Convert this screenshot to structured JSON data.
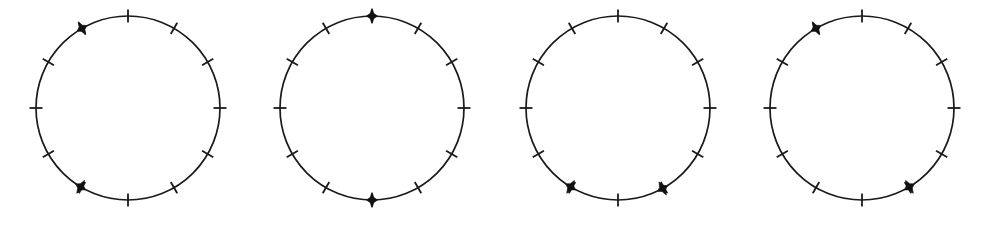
{
  "figure": {
    "kind": "geometry-diagram",
    "background_color": "#ffffff",
    "stroke_color": "#1a1a1a",
    "marker_color": "#111111",
    "canvas": {
      "width": 989,
      "height": 225
    },
    "circle_radius": 92,
    "tick_count": 12,
    "tick_length": 13,
    "tick_stroke_width": 1.8,
    "circle_stroke_width": 1.7,
    "marker_radius_x": 5.5,
    "marker_radius_y": 7.5,
    "panels": [
      {
        "id": "panel-1",
        "label": "circle-1",
        "center_x": 128,
        "center_y": 108,
        "tick_angles_deg": [
          0,
          30,
          60,
          90,
          120,
          150,
          180,
          210,
          240,
          270,
          300,
          330
        ],
        "markers": [
          {
            "name": "marker-a",
            "angle_deg": 330,
            "clock_position": "11"
          },
          {
            "name": "marker-b",
            "angle_deg": 211,
            "clock_position": "7"
          }
        ]
      },
      {
        "id": "panel-2",
        "label": "circle-2",
        "center_x": 372,
        "center_y": 108,
        "tick_angles_deg": [
          0,
          30,
          60,
          90,
          120,
          150,
          180,
          210,
          240,
          270,
          300,
          330
        ],
        "markers": [
          {
            "name": "marker-a",
            "angle_deg": 0,
            "clock_position": "12"
          },
          {
            "name": "marker-b",
            "angle_deg": 180,
            "clock_position": "6"
          }
        ]
      },
      {
        "id": "panel-3",
        "label": "circle-3",
        "center_x": 618,
        "center_y": 108,
        "tick_angles_deg": [
          0,
          30,
          60,
          90,
          120,
          150,
          180,
          210,
          240,
          270,
          300,
          330
        ],
        "markers": [
          {
            "name": "marker-a",
            "angle_deg": 211,
            "clock_position": "7"
          },
          {
            "name": "marker-b",
            "angle_deg": 151,
            "clock_position": "5"
          }
        ]
      },
      {
        "id": "panel-4",
        "label": "circle-4",
        "center_x": 862,
        "center_y": 108,
        "tick_angles_deg": [
          0,
          30,
          60,
          90,
          120,
          150,
          180,
          210,
          240,
          270,
          300,
          330
        ],
        "markers": [
          {
            "name": "marker-a",
            "angle_deg": 330,
            "clock_position": "11"
          },
          {
            "name": "marker-b",
            "angle_deg": 149,
            "clock_position": "5"
          }
        ]
      }
    ]
  }
}
